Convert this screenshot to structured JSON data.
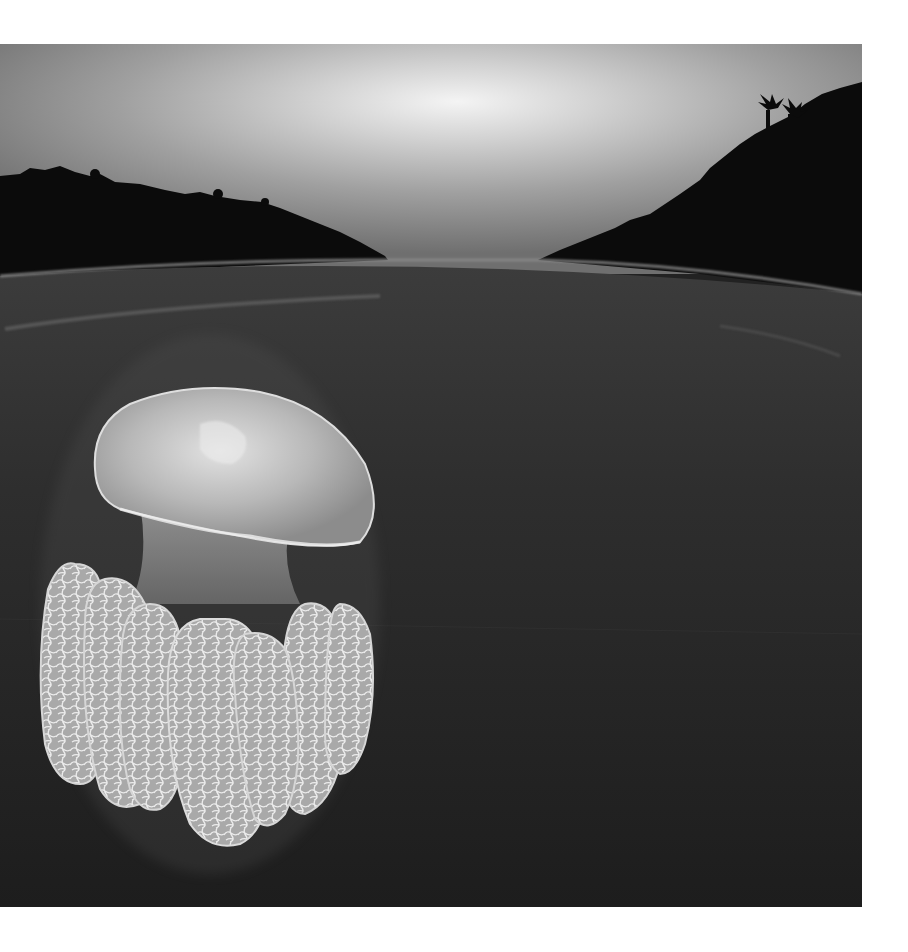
{
  "page": {
    "background": "#ffffff",
    "width": 908,
    "height": 952
  },
  "photo": {
    "alt": "Black and white split-level photograph: sky with dark forested hills above the water line, a moon jellyfish with large lace-patterned oral arms below the surface",
    "style": "monochrome",
    "region": {
      "x": 0,
      "y": 44,
      "width": 862,
      "height": 863
    },
    "colors": {
      "sky_top": "#7a7a7a",
      "sky_glow": "#f2f2f2",
      "hills": "#0b0b0b",
      "water_surface_line": "#8a8a8a",
      "water_top": "#3a3a3a",
      "water_bottom": "#1c1c1c",
      "jelly_bell": "#c8c8c8",
      "jelly_arms": "#bdbdbd"
    }
  }
}
